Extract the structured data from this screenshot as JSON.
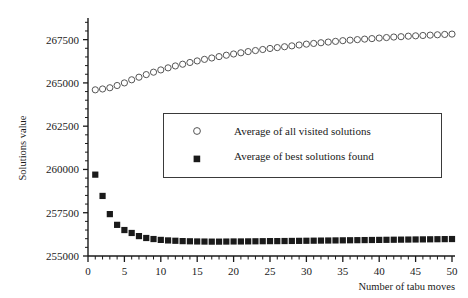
{
  "chart_data": {
    "type": "scatter",
    "title": "",
    "xlabel": "Number of tabu moves",
    "ylabel": "Solutions value",
    "xlim": [
      0,
      50
    ],
    "ylim": [
      255000,
      268750
    ],
    "grid": false,
    "legend_position": "inside-upper-middle",
    "xticks": [
      0,
      5,
      10,
      15,
      20,
      25,
      30,
      35,
      40,
      45,
      50
    ],
    "xtick_labels": [
      "0",
      "5",
      "10",
      "15",
      "20",
      "25",
      "30",
      "35",
      "40",
      "45",
      "50"
    ],
    "yticks": [
      255000,
      257500,
      260000,
      262500,
      265000,
      267500
    ],
    "ytick_labels": [
      "255000",
      "257500",
      "260000",
      "262500",
      "265000",
      "267500"
    ],
    "x_minor_tick_step": 1,
    "y_minor_tick_step": 500,
    "series": [
      {
        "name": "Average of all visited solutions",
        "marker": "open-circle",
        "color": "#555555",
        "x": [
          1,
          2,
          3,
          4,
          5,
          6,
          7,
          8,
          9,
          10,
          11,
          12,
          13,
          14,
          15,
          16,
          17,
          18,
          19,
          20,
          21,
          22,
          23,
          24,
          25,
          26,
          27,
          28,
          29,
          30,
          31,
          32,
          33,
          34,
          35,
          36,
          37,
          38,
          39,
          40,
          41,
          42,
          43,
          44,
          45,
          46,
          47,
          48,
          49,
          50
        ],
        "values": [
          264600,
          264650,
          264720,
          264850,
          265000,
          265180,
          265330,
          265480,
          265620,
          265750,
          265870,
          265980,
          266080,
          266180,
          266270,
          266360,
          266440,
          266520,
          266600,
          266670,
          266740,
          266810,
          266870,
          266930,
          266990,
          267040,
          267090,
          267140,
          267190,
          267240,
          267280,
          267320,
          267360,
          267400,
          267440,
          267470,
          267500,
          267530,
          267560,
          267590,
          267620,
          267650,
          267670,
          267700,
          267720,
          267740,
          267760,
          267780,
          267800,
          267820
        ]
      },
      {
        "name": "Average of best solutions found",
        "marker": "filled-square",
        "color": "#1a1a1a",
        "x": [
          1,
          2,
          3,
          4,
          5,
          6,
          7,
          8,
          9,
          10,
          11,
          12,
          13,
          14,
          15,
          16,
          17,
          18,
          19,
          20,
          21,
          22,
          23,
          24,
          25,
          26,
          27,
          28,
          29,
          30,
          31,
          32,
          33,
          34,
          35,
          36,
          37,
          38,
          39,
          40,
          41,
          42,
          43,
          44,
          45,
          46,
          47,
          48,
          49,
          50
        ],
        "values": [
          259700,
          258470,
          257420,
          256800,
          256500,
          256330,
          256150,
          256040,
          255980,
          255930,
          255900,
          255880,
          255860,
          255850,
          255840,
          255835,
          255830,
          255830,
          255835,
          255840,
          255840,
          255845,
          255850,
          255855,
          255860,
          255860,
          255865,
          255870,
          255875,
          255880,
          255885,
          255890,
          255895,
          255900,
          255905,
          255910,
          255915,
          255920,
          255925,
          255930,
          255935,
          255940,
          255945,
          255950,
          255955,
          255960,
          255965,
          255970,
          255975,
          255980
        ]
      }
    ]
  },
  "legend": {
    "entries": [
      {
        "marker": "open-circle",
        "label": "Average of all visited solutions"
      },
      {
        "marker": "filled-square",
        "label": "Average of best solutions found"
      }
    ]
  }
}
